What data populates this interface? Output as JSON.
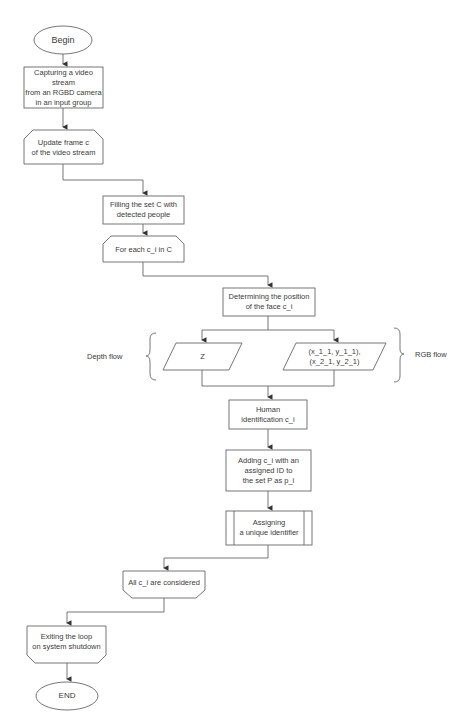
{
  "flowchart": {
    "begin": "Begin",
    "capture": "Capturing a video stream\nfrom an RGBD camera\nin an input group",
    "update_frame": "Update frame c\nof the video stream",
    "filling_set": "Filling the set C with\ndetected people",
    "for_each": "For each c_i in C",
    "face_position": "Determining the position\nof the face c_i",
    "depth_value": "Z",
    "rgb_value": "(x_1_1, y_1_1),\n(x_2_1, y_2_1)",
    "depth_label": "Depth flow",
    "rgb_label": "RGB flow",
    "human_id": "Human\nidentification c_i",
    "adding": "Adding c_i with an\nassigned ID to\nthe set P as p_i",
    "assigning": "Assigning\na unique identifier",
    "all_considered": "All c_i are considered",
    "exiting": "Exiting the loop\non system shutdown",
    "end": "END"
  },
  "colors": {
    "stroke": "#555555",
    "text": "#3a3a3a",
    "background": "#ffffff"
  }
}
